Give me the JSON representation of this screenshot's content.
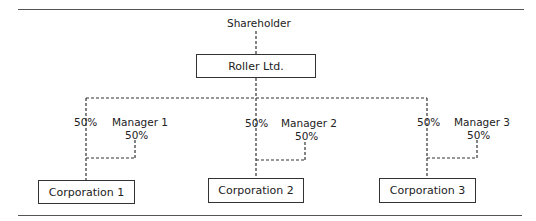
{
  "diagram": {
    "type": "ownership-structure",
    "top": {
      "label": "Shareholder"
    },
    "parent": {
      "label": "Roller Ltd."
    },
    "branches": [
      {
        "corporation": "Corporation 1",
        "parent_share": "50%",
        "manager": "Manager 1",
        "manager_share": "50%"
      },
      {
        "corporation": "Corporation 2",
        "parent_share": "50%",
        "manager": "Manager 2",
        "manager_share": "50%"
      },
      {
        "corporation": "Corporation 3",
        "parent_share": "50%",
        "manager": "Manager 3",
        "manager_share": "50%"
      }
    ],
    "colors": {
      "line": "#333333",
      "rule": "#555555",
      "text": "#222222",
      "background": "#ffffff"
    }
  }
}
